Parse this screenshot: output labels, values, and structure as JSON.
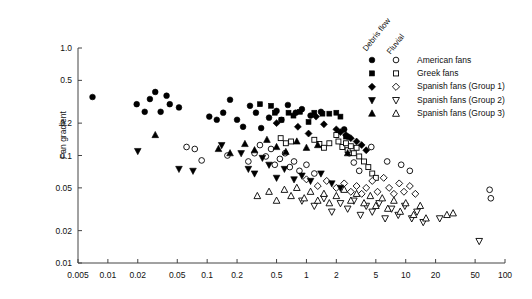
{
  "chart_data": {
    "type": "scatter",
    "title": "",
    "xlabel": "",
    "ylabel": "Fan gradient",
    "xscale": "log",
    "yscale": "log",
    "xlim": [
      0.005,
      100
    ],
    "ylim": [
      0.01,
      1.0
    ],
    "xticks": [
      0.005,
      0.01,
      0.02,
      0.05,
      0.1,
      0.2,
      0.5,
      1,
      2,
      5,
      10,
      20,
      50,
      100
    ],
    "xticklabels": [
      "0.005",
      "0.01",
      "0.02",
      "0.05",
      "0.1",
      "0.2",
      "0.5",
      "1",
      "2",
      "5",
      "10",
      "20",
      "50",
      "100"
    ],
    "yticks": [
      0.01,
      0.02,
      0.05,
      0.1,
      0.2,
      0.5,
      1.0
    ],
    "yticklabels": [
      "0.01",
      "0.02",
      "0.05",
      "0.1",
      "0.2",
      "0.5",
      "1.0"
    ],
    "grid": false,
    "legend_position": "top-right",
    "legend_column_headers": [
      "Debris flow",
      "Fluvial"
    ],
    "series": [
      {
        "name": "American fans",
        "process": "debris flow",
        "marker": "circle",
        "fill": "solid",
        "color": "#000000",
        "points": [
          [
            0.007,
            0.35
          ],
          [
            0.0195,
            0.3
          ],
          [
            0.0235,
            0.255
          ],
          [
            0.0265,
            0.335
          ],
          [
            0.03,
            0.39
          ],
          [
            0.034,
            0.255
          ],
          [
            0.039,
            0.36
          ],
          [
            0.042,
            0.3
          ],
          [
            0.052,
            0.28
          ],
          [
            0.105,
            0.23
          ],
          [
            0.125,
            0.215
          ],
          [
            0.145,
            0.25
          ],
          [
            0.17,
            0.33
          ],
          [
            0.2,
            0.215
          ],
          [
            0.23,
            0.185
          ],
          [
            0.27,
            0.29
          ],
          [
            0.31,
            0.25
          ],
          [
            0.35,
            0.18
          ],
          [
            0.42,
            0.225
          ],
          [
            0.5,
            0.26
          ],
          [
            0.56,
            0.215
          ],
          [
            0.65,
            0.295
          ],
          [
            0.78,
            0.25
          ],
          [
            0.9,
            0.27
          ],
          [
            1.1,
            0.235
          ],
          [
            1.4,
            0.255
          ],
          [
            2.4,
            0.175
          ],
          [
            2.6,
            0.15
          ]
        ]
      },
      {
        "name": "American fans",
        "process": "fluvial",
        "marker": "circle",
        "fill": "open",
        "color": "#000000",
        "points": [
          [
            0.062,
            0.12
          ],
          [
            0.075,
            0.115
          ],
          [
            0.088,
            0.09
          ],
          [
            0.16,
            0.1
          ],
          [
            0.26,
            0.088
          ],
          [
            0.3,
            0.105
          ],
          [
            0.34,
            0.125
          ],
          [
            0.39,
            0.098
          ],
          [
            0.44,
            0.115
          ],
          [
            0.48,
            0.082
          ],
          [
            0.54,
            0.093
          ],
          [
            0.61,
            0.105
          ],
          [
            0.68,
            0.078
          ],
          [
            0.75,
            0.088
          ],
          [
            0.85,
            0.072
          ],
          [
            1.0,
            0.082
          ],
          [
            1.2,
            0.068
          ],
          [
            2.7,
            0.105
          ],
          [
            3.0,
            0.086
          ],
          [
            3.4,
            0.072
          ],
          [
            4.5,
            0.12
          ],
          [
            6.5,
            0.088
          ],
          [
            9.0,
            0.082
          ],
          [
            11.0,
            0.072
          ],
          [
            70.0,
            0.048
          ],
          [
            72.0,
            0.04
          ]
        ]
      },
      {
        "name": "Greek fans",
        "process": "debris flow",
        "marker": "square",
        "fill": "solid",
        "color": "#000000",
        "points": [
          [
            0.34,
            0.3
          ],
          [
            0.44,
            0.29
          ],
          [
            0.48,
            0.25
          ],
          [
            0.56,
            0.215
          ],
          [
            0.66,
            0.25
          ],
          [
            0.74,
            0.235
          ],
          [
            0.86,
            0.255
          ],
          [
            1.05,
            0.205
          ],
          [
            1.2,
            0.25
          ],
          [
            1.45,
            0.245
          ],
          [
            1.7,
            0.245
          ],
          [
            2.0,
            0.25
          ],
          [
            2.2,
            0.23
          ],
          [
            2.5,
            0.15
          ]
        ]
      },
      {
        "name": "Greek fans",
        "process": "fluvial",
        "marker": "square",
        "fill": "open",
        "color": "#000000",
        "points": [
          [
            0.55,
            0.145
          ],
          [
            0.62,
            0.13
          ],
          [
            0.7,
            0.135
          ],
          [
            1.2,
            0.14
          ],
          [
            1.35,
            0.128
          ],
          [
            1.5,
            0.118
          ],
          [
            1.7,
            0.13
          ],
          [
            2.0,
            0.155
          ],
          [
            2.1,
            0.135
          ],
          [
            2.3,
            0.12
          ],
          [
            2.5,
            0.13
          ],
          [
            2.6,
            0.112
          ],
          [
            2.8,
            0.122
          ],
          [
            3.0,
            0.105
          ],
          [
            3.2,
            0.118
          ],
          [
            3.4,
            0.098
          ],
          [
            3.8,
            0.088
          ],
          [
            4.2,
            0.078
          ],
          [
            4.6,
            0.068
          ],
          [
            5.0,
            0.062
          ]
        ]
      },
      {
        "name": "Spanish fans (Group 1)",
        "process": "debris flow",
        "marker": "diamond",
        "fill": "solid",
        "color": "#000000",
        "points": [
          [
            0.5,
            0.2
          ],
          [
            0.82,
            0.185
          ],
          [
            1.05,
            0.16
          ],
          [
            1.25,
            0.23
          ],
          [
            1.5,
            0.195
          ],
          [
            2.0,
            0.175
          ],
          [
            2.2,
            0.165
          ],
          [
            2.5,
            0.155
          ],
          [
            2.8,
            0.145
          ],
          [
            3.2,
            0.135
          ],
          [
            3.6,
            0.125
          ],
          [
            4.0,
            0.112
          ]
        ]
      },
      {
        "name": "Spanish fans (Group 1)",
        "process": "fluvial",
        "marker": "diamond",
        "fill": "open",
        "color": "#000000",
        "points": [
          [
            1.0,
            0.06
          ],
          [
            1.3,
            0.052
          ],
          [
            1.6,
            0.058
          ],
          [
            2.0,
            0.05
          ],
          [
            2.4,
            0.055
          ],
          [
            2.8,
            0.046
          ],
          [
            3.2,
            0.052
          ],
          [
            3.6,
            0.044
          ],
          [
            4.0,
            0.05
          ],
          [
            4.6,
            0.058
          ],
          [
            5.2,
            0.046
          ],
          [
            6.0,
            0.062
          ],
          [
            6.8,
            0.05
          ],
          [
            7.6,
            0.044
          ],
          [
            8.6,
            0.055
          ],
          [
            9.6,
            0.046
          ],
          [
            11.0,
            0.052
          ],
          [
            12.5,
            0.044
          ]
        ]
      },
      {
        "name": "Spanish fans (Group 2)",
        "process": "debris flow",
        "marker": "triangle-down",
        "fill": "solid",
        "color": "#000000",
        "points": [
          [
            0.02,
            0.11
          ],
          [
            0.052,
            0.075
          ],
          [
            0.072,
            0.072
          ],
          [
            0.14,
            0.125
          ],
          [
            0.22,
            0.105
          ],
          [
            0.26,
            0.075
          ],
          [
            0.3,
            0.068
          ],
          [
            0.36,
            0.095
          ],
          [
            0.42,
            0.082
          ],
          [
            0.5,
            0.062
          ],
          [
            0.6,
            0.075
          ],
          [
            0.75,
            0.06
          ],
          [
            0.9,
            0.065
          ],
          [
            1.1,
            0.058
          ],
          [
            1.4,
            0.068
          ],
          [
            1.8,
            0.055
          ],
          [
            2.2,
            0.05
          ]
        ]
      },
      {
        "name": "Spanish fans (Group 2)",
        "process": "fluvial",
        "marker": "triangle-down",
        "fill": "open",
        "color": "#000000",
        "points": [
          [
            0.9,
            0.038
          ],
          [
            1.2,
            0.034
          ],
          [
            1.5,
            0.04
          ],
          [
            1.8,
            0.03
          ],
          [
            2.2,
            0.036
          ],
          [
            2.6,
            0.032
          ],
          [
            3.0,
            0.038
          ],
          [
            3.5,
            0.028
          ],
          [
            4.0,
            0.034
          ],
          [
            4.6,
            0.03
          ],
          [
            5.4,
            0.036
          ],
          [
            6.2,
            0.026
          ],
          [
            7.2,
            0.032
          ],
          [
            8.4,
            0.028
          ],
          [
            9.8,
            0.034
          ],
          [
            11.5,
            0.026
          ],
          [
            13.0,
            0.03
          ],
          [
            15.0,
            0.024
          ],
          [
            22.0,
            0.026
          ],
          [
            55.0,
            0.016
          ]
        ]
      },
      {
        "name": "Spanish fans (Group 3)",
        "process": "debris flow",
        "marker": "triangle-up",
        "fill": "solid",
        "color": "#000000",
        "points": [
          [
            0.03,
            0.155
          ],
          [
            0.13,
            0.115
          ],
          [
            0.17,
            0.105
          ],
          [
            0.24,
            0.128
          ],
          [
            0.3,
            0.112
          ],
          [
            0.4,
            0.14
          ],
          [
            0.5,
            0.12
          ],
          [
            0.62,
            0.108
          ],
          [
            0.8,
            0.135
          ],
          [
            1.0,
            0.118
          ],
          [
            1.3,
            0.125
          ],
          [
            2.6,
            0.105
          ]
        ]
      },
      {
        "name": "Spanish fans (Group 3)",
        "process": "fluvial",
        "marker": "triangle-up",
        "fill": "open",
        "color": "#000000",
        "points": [
          [
            0.32,
            0.042
          ],
          [
            0.42,
            0.046
          ],
          [
            0.5,
            0.038
          ],
          [
            0.6,
            0.048
          ],
          [
            0.7,
            0.042
          ],
          [
            0.8,
            0.05
          ],
          [
            0.95,
            0.04
          ],
          [
            1.1,
            0.046
          ],
          [
            1.3,
            0.038
          ],
          [
            1.5,
            0.044
          ],
          [
            1.7,
            0.036
          ],
          [
            2.0,
            0.042
          ],
          [
            2.4,
            0.048
          ],
          [
            2.8,
            0.038
          ],
          [
            3.2,
            0.044
          ],
          [
            3.8,
            0.036
          ],
          [
            4.4,
            0.042
          ],
          [
            5.0,
            0.034
          ],
          [
            5.8,
            0.04
          ],
          [
            6.6,
            0.032
          ],
          [
            7.6,
            0.038
          ],
          [
            8.8,
            0.03
          ],
          [
            10.0,
            0.036
          ],
          [
            12.0,
            0.028
          ],
          [
            14.0,
            0.034
          ],
          [
            16.0,
            0.026
          ],
          [
            26.0,
            0.028
          ],
          [
            30.0,
            0.029
          ]
        ]
      }
    ]
  },
  "legend": {
    "headers": {
      "debris_flow": "Debris flow",
      "fluvial": "Fluvial"
    },
    "rows": [
      {
        "label": "American fans"
      },
      {
        "label": "Greek fans"
      },
      {
        "label": "Spanish fans (Group 1)"
      },
      {
        "label": "Spanish fans (Group 2)"
      },
      {
        "label": "Spanish fans (Group 3)"
      }
    ]
  },
  "axes": {
    "y_title": "Fan gradient"
  }
}
